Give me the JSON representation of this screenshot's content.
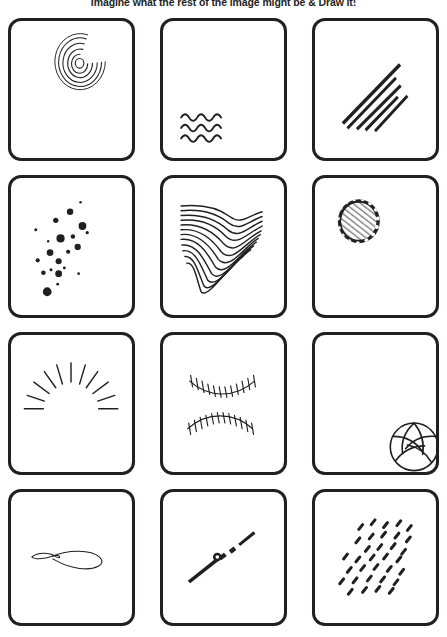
{
  "worksheet": {
    "title": "Imagine what the rest of the image might be & Draw it!",
    "ink_color": "#231f20",
    "paper_color": "#ffffff",
    "grid": {
      "columns": 3,
      "rows": 4,
      "card_count": 12
    },
    "cards": [
      {
        "index": 1,
        "name": "ripple-rings-card",
        "prompt_type": "concentric-ripple-rings",
        "description": "Concentric circular ripple rings in the upper right",
        "position": "row-1-col-1"
      },
      {
        "index": 2,
        "name": "water-waves-card",
        "prompt_type": "wave-rows",
        "description": "Three rows of small water waves in the lower left",
        "position": "row-1-col-2"
      },
      {
        "index": 3,
        "name": "speed-lines-card",
        "prompt_type": "diagonal-speed-lines",
        "description": "Five tapered diagonal motion streaks rising to the right",
        "position": "row-1-col-3"
      },
      {
        "index": 4,
        "name": "scattered-dots-card",
        "prompt_type": "scattered-dots",
        "description": "Cluster of round dots of varying sizes scattered diagonally",
        "position": "row-2-col-1"
      },
      {
        "index": 5,
        "name": "flowing-lines-card",
        "prompt_type": "flowing-s-curves",
        "description": "Many parallel flowing S-curve contour lines filling the left half",
        "position": "row-2-col-2"
      },
      {
        "index": 6,
        "name": "golf-ball-card",
        "prompt_type": "dimpled-sphere",
        "description": "Small dimpled crosshatched ball in the upper left",
        "position": "row-2-col-3"
      },
      {
        "index": 7,
        "name": "sunburst-rays-card",
        "prompt_type": "radiating-rays",
        "description": "Eleven radiating straight rays fanning upward like a sunrise",
        "position": "row-3-col-1"
      },
      {
        "index": 8,
        "name": "baseball-stitches-card",
        "prompt_type": "baseball-stitching",
        "description": "Two curved rows of baseball stitch marks",
        "position": "row-3-col-2"
      },
      {
        "index": 9,
        "name": "volleyball-card",
        "prompt_type": "volleyball",
        "description": "Volleyball with curved panel seams in the bottom right corner",
        "position": "row-3-col-3"
      },
      {
        "index": 10,
        "name": "loop-line-card",
        "prompt_type": "looping-string",
        "description": "Thin horizontal line forming an open loop, like a lasso or string",
        "position": "row-4-col-1"
      },
      {
        "index": 11,
        "name": "needle-dart-card",
        "prompt_type": "diagonal-needle",
        "description": "Diagonal tapered needle or dart shape with dashed tail",
        "position": "row-4-col-2"
      },
      {
        "index": 12,
        "name": "falling-dashes-card",
        "prompt_type": "scattered-dashes",
        "description": "Field of short slanted dashes like falling rain or seeds",
        "position": "row-4-col-3"
      }
    ]
  }
}
